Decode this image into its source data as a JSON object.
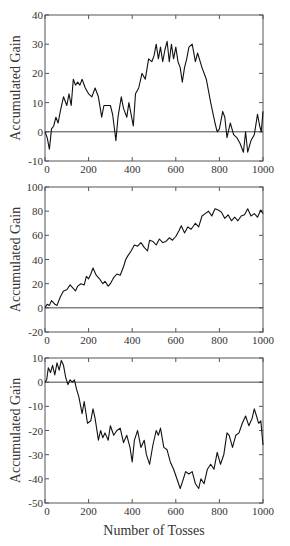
{
  "chart_data": [
    {
      "type": "line",
      "title": "",
      "xlabel": "",
      "ylabel": "Accumulated Gain",
      "xlim": [
        0,
        1000
      ],
      "ylim": [
        -10,
        40
      ],
      "xticks": [
        0,
        200,
        400,
        600,
        800,
        1000
      ],
      "xtick_labels": [
        "0",
        "200",
        "400",
        "600",
        "800",
        "1000"
      ],
      "yticks": [
        -10,
        0,
        10,
        20,
        30,
        40
      ],
      "ytick_labels": [
        "-10",
        "0",
        "10",
        "20",
        "30",
        "40"
      ],
      "reference_line": 0,
      "grid": false,
      "series": [
        {
          "name": "Accumulated Gain",
          "x": [
            0,
            10,
            20,
            30,
            40,
            50,
            60,
            70,
            85,
            100,
            110,
            120,
            130,
            140,
            150,
            160,
            170,
            185,
            200,
            215,
            230,
            245,
            260,
            270,
            280,
            300,
            310,
            320,
            325,
            335,
            350,
            360,
            375,
            385,
            395,
            405,
            415,
            430,
            445,
            460,
            475,
            490,
            500,
            510,
            520,
            530,
            540,
            550,
            560,
            570,
            580,
            590,
            600,
            610,
            620,
            630,
            640,
            650,
            660,
            675,
            690,
            700,
            720,
            740,
            760,
            780,
            790,
            800,
            815,
            825,
            835,
            850,
            865,
            880,
            895,
            910,
            920,
            930,
            945,
            960,
            975,
            985,
            992,
            1000
          ],
          "y": [
            0,
            -2,
            -6,
            1,
            2,
            5,
            3,
            7,
            12,
            9,
            13,
            9,
            18,
            16,
            17,
            16,
            18,
            15,
            13,
            12,
            15,
            12,
            5,
            9,
            9,
            9,
            6,
            0,
            -3,
            5,
            12,
            8,
            5,
            10,
            6,
            2,
            13,
            15,
            20,
            18,
            25,
            24,
            26,
            30,
            25,
            29,
            24,
            28,
            31,
            24,
            30,
            25,
            29,
            24,
            22,
            17,
            22,
            25,
            29,
            30,
            24,
            27,
            22,
            18,
            10,
            3,
            0,
            1,
            7,
            5,
            -2,
            3,
            -1,
            -2,
            -4,
            -7,
            0,
            -7,
            -3,
            -1,
            6,
            2,
            0,
            7
          ]
        }
      ]
    },
    {
      "type": "line",
      "title": "",
      "xlabel": "",
      "ylabel": "Accumulated Gain",
      "xlim": [
        0,
        1000
      ],
      "ylim": [
        -20,
        100
      ],
      "xticks": [
        0,
        200,
        400,
        600,
        800,
        1000
      ],
      "xtick_labels": [
        "0",
        "200",
        "400",
        "600",
        "800",
        "1000"
      ],
      "yticks": [
        -20,
        0,
        20,
        40,
        60,
        80,
        100
      ],
      "ytick_labels": [
        "-20",
        "0",
        "20",
        "40",
        "60",
        "80",
        "100"
      ],
      "reference_line": 0,
      "grid": false,
      "series": [
        {
          "name": "Accumulated Gain",
          "x": [
            0,
            10,
            20,
            30,
            45,
            55,
            70,
            85,
            100,
            115,
            125,
            140,
            150,
            165,
            180,
            190,
            200,
            210,
            220,
            235,
            250,
            265,
            275,
            290,
            300,
            315,
            330,
            345,
            360,
            370,
            380,
            395,
            410,
            425,
            440,
            455,
            470,
            480,
            495,
            510,
            525,
            540,
            555,
            570,
            585,
            600,
            615,
            625,
            640,
            655,
            670,
            690,
            705,
            720,
            735,
            750,
            765,
            780,
            795,
            810,
            825,
            840,
            855,
            870,
            885,
            900,
            915,
            930,
            945,
            960,
            975,
            990,
            1000
          ],
          "y": [
            0,
            3,
            2,
            6,
            3,
            2,
            9,
            14,
            15,
            19,
            17,
            14,
            18,
            20,
            19,
            26,
            24,
            28,
            33,
            27,
            24,
            20,
            22,
            18,
            20,
            25,
            28,
            27,
            34,
            40,
            43,
            47,
            52,
            51,
            54,
            50,
            47,
            56,
            55,
            52,
            57,
            54,
            55,
            58,
            56,
            59,
            64,
            68,
            62,
            67,
            65,
            70,
            67,
            76,
            78,
            80,
            76,
            82,
            81,
            79,
            74,
            77,
            72,
            75,
            72,
            76,
            77,
            82,
            76,
            78,
            75,
            81,
            78
          ]
        }
      ]
    },
    {
      "type": "line",
      "title": "",
      "xlabel": "Number of Tosses",
      "ylabel": "Accumulated Gain",
      "xlim": [
        0,
        1000
      ],
      "ylim": [
        -50,
        10
      ],
      "xticks": [
        0,
        200,
        400,
        600,
        800,
        1000
      ],
      "xtick_labels": [
        "0",
        "200",
        "400",
        "600",
        "800",
        "1000"
      ],
      "yticks": [
        -50,
        -40,
        -30,
        -20,
        -10,
        0,
        10
      ],
      "ytick_labels": [
        "-50",
        "-40",
        "-30",
        "-20",
        "-10",
        "0",
        "10"
      ],
      "reference_line": 0,
      "grid": false,
      "series": [
        {
          "name": "Accumulated Gain",
          "x": [
            0,
            8,
            15,
            25,
            35,
            45,
            55,
            65,
            75,
            85,
            95,
            105,
            115,
            125,
            135,
            145,
            155,
            170,
            180,
            195,
            210,
            220,
            230,
            245,
            255,
            265,
            275,
            290,
            300,
            315,
            330,
            345,
            360,
            375,
            390,
            400,
            410,
            425,
            440,
            455,
            465,
            480,
            495,
            510,
            520,
            530,
            545,
            560,
            575,
            590,
            605,
            620,
            635,
            645,
            660,
            675,
            690,
            705,
            715,
            730,
            745,
            760,
            775,
            790,
            805,
            820,
            835,
            845,
            860,
            875,
            890,
            905,
            920,
            935,
            950,
            960,
            970,
            980,
            990,
            1000
          ],
          "y": [
            0,
            1,
            6,
            4,
            7,
            3,
            8,
            5,
            9,
            7,
            2,
            -1,
            1,
            0,
            1,
            -3,
            -6,
            -13,
            -8,
            -17,
            -16,
            -11,
            -15,
            -24,
            -20,
            -23,
            -21,
            -24,
            -18,
            -22,
            -20,
            -19,
            -25,
            -22,
            -27,
            -33,
            -24,
            -20,
            -27,
            -24,
            -30,
            -34,
            -26,
            -20,
            -22,
            -19,
            -27,
            -28,
            -33,
            -36,
            -40,
            -44,
            -40,
            -37,
            -38,
            -37,
            -42,
            -44,
            -40,
            -42,
            -36,
            -34,
            -36,
            -29,
            -34,
            -30,
            -21,
            -22,
            -27,
            -22,
            -21,
            -17,
            -14,
            -18,
            -15,
            -11,
            -14,
            -17,
            -16,
            -26
          ]
        }
      ]
    }
  ]
}
